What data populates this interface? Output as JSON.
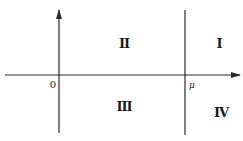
{
  "diagram": {
    "type": "quadrant-plane",
    "stroke_color": "#2a2a2a",
    "axes": {
      "x_axis": {
        "y": 75,
        "x_start": 5,
        "x_end": 240,
        "arrow": "right"
      },
      "y_axis": {
        "x": 59,
        "y_start": 133,
        "y_end": 10,
        "arrow": "up"
      },
      "vertical_line": {
        "x": 185,
        "y_start": 10,
        "y_end": 135
      }
    },
    "labels": {
      "origin": "0",
      "mu": "μ",
      "region_1": "I",
      "region_2": "II",
      "region_3": "III",
      "region_4": "IV"
    }
  }
}
